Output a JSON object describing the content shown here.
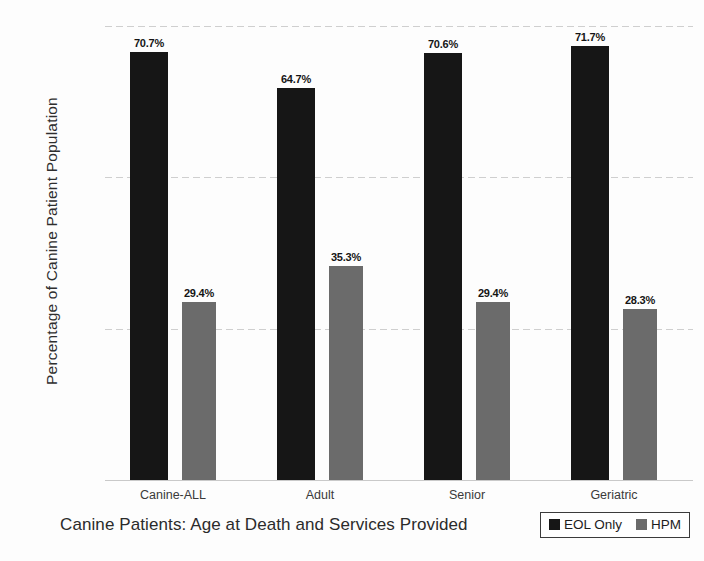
{
  "chart_data": {
    "type": "bar",
    "title": "",
    "xlabel": "Canine Patients: Age at Death and Services Provided",
    "ylabel": "Percentage of Canine Patient Population",
    "categories": [
      "Canine-ALL",
      "Adult",
      "Senior",
      "Geriatric"
    ],
    "series": [
      {
        "name": "EOL Only",
        "color": "#161616",
        "values": [
          70.7,
          64.7,
          70.6,
          71.7
        ],
        "labels": [
          "70.7%",
          "64.7%",
          "70.6%",
          "71.7%"
        ]
      },
      {
        "name": "HPM",
        "color": "#6b6b6b",
        "values": [
          29.4,
          35.3,
          29.4,
          28.3
        ],
        "labels": [
          "29.4%",
          "35.3%",
          "29.4%",
          "28.3%"
        ]
      }
    ],
    "ylim": [
      0,
      75
    ],
    "yticks": [
      0,
      25,
      50,
      75
    ],
    "ytick_labels": [
      "0%",
      "25%",
      "50%",
      "75%"
    ],
    "grid": true,
    "legend_position": "bottom-right"
  },
  "axis": {
    "y_title": "Percentage of Canine Patient Population",
    "x_title": "Canine Patients: Age at Death and Services Provided"
  },
  "legend": {
    "items": [
      {
        "label": "EOL Only",
        "color": "#161616"
      },
      {
        "label": "HPM",
        "color": "#6b6b6b"
      }
    ]
  }
}
